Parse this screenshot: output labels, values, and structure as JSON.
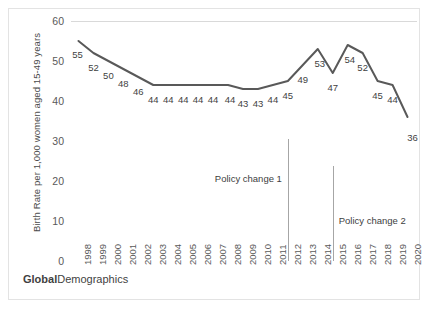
{
  "chart_data": {
    "type": "line",
    "title": "",
    "xlabel": "",
    "ylabel": "Birth Rate per 1,000 women aged 15-49 years",
    "ylim": [
      0,
      60
    ],
    "yticks": [
      60,
      50,
      40,
      30,
      20,
      10,
      0
    ],
    "grid": false,
    "legend": "none",
    "line_color": "#595959",
    "categories": [
      "1998",
      "1999",
      "2000",
      "2001",
      "2002",
      "2003",
      "2004",
      "2005",
      "2006",
      "2007",
      "2008",
      "2009",
      "2010",
      "2011",
      "2012",
      "2013",
      "2014",
      "2015",
      "2016",
      "2017",
      "2018",
      "2019",
      "2020"
    ],
    "values": [
      55,
      52,
      50,
      48,
      46,
      44,
      44,
      44,
      44,
      44,
      44,
      43,
      43,
      44,
      45,
      49,
      53,
      47,
      54,
      52,
      45,
      44,
      36
    ],
    "data_labels": [
      "55",
      "52",
      "50",
      "48",
      "46",
      "44",
      "44",
      "44",
      "44",
      "44",
      "44",
      "43",
      "43",
      "44",
      "45",
      "49",
      "53",
      "47",
      "54",
      "52",
      "45",
      "44",
      "36"
    ],
    "annotations": [
      {
        "text": "Policy change 1",
        "at_category": "2012",
        "align": "right"
      },
      {
        "text": "Policy change 2",
        "at_category": "2015",
        "align": "left"
      }
    ]
  },
  "footer": {
    "brand_bold": "Global",
    "brand_regular": "Demographics"
  }
}
